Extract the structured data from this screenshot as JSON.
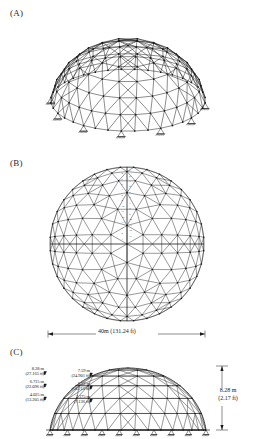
{
  "figure": {
    "panels": [
      {
        "id": "A",
        "label": "(A)",
        "caption_role": "perspective-view"
      },
      {
        "id": "B",
        "label": "(B)",
        "caption_role": "plan-view"
      },
      {
        "id": "C",
        "label": "(C)",
        "caption_role": "elevation-view"
      }
    ]
  },
  "panel_a": {
    "label": "(A)",
    "view": "3D perspective of triangulated lamella dome with pinned perimeter supports",
    "support_count": 12
  },
  "panel_b": {
    "label": "(B)",
    "view": "plan (top) view of dome with radial and ring members",
    "span_label": "40m (131.24 ft)",
    "member_group_labels": [
      "1",
      "2",
      "3",
      "4",
      "5",
      "6",
      "7",
      "8",
      "9",
      "10",
      "11",
      "12",
      "13"
    ]
  },
  "panel_c": {
    "label": "(C)",
    "view": "side elevation showing ring heights",
    "heights": [
      {
        "metric": "8.28 m",
        "imperial": "(27.165 ft)"
      },
      {
        "metric": "6.715 m",
        "imperial": "(22.096 ft)"
      },
      {
        "metric": "4.025 m",
        "imperial": "(13.205 ft)"
      }
    ],
    "inner_heights": [
      {
        "metric": "7.59 m",
        "imperial": "(24.901 ft)"
      },
      {
        "metric": "5.52 m",
        "imperial": "(18.215 ft)"
      },
      {
        "metric": "2.175 m",
        "imperial": "(7.136 ft)"
      }
    ],
    "total_rise": {
      "metric": "8.28 m",
      "imperial": "(2.17 ft)"
    }
  },
  "colors": {
    "line": "#1a1a1a",
    "text": "#1a1a1a",
    "background": "#ffffff",
    "light_line": "#555555"
  }
}
